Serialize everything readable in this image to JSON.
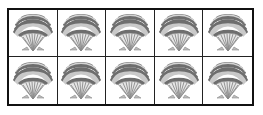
{
  "frame": {
    "rows": 2,
    "columns": 5,
    "border_color": "#111111"
  },
  "cells": [
    {
      "icon": "scallop-shell-icon"
    },
    {
      "icon": "scallop-shell-icon"
    },
    {
      "icon": "scallop-shell-icon"
    },
    {
      "icon": "scallop-shell-icon"
    },
    {
      "icon": "scallop-shell-icon"
    },
    {
      "icon": "scallop-shell-icon"
    },
    {
      "icon": "scallop-shell-icon"
    },
    {
      "icon": "scallop-shell-icon"
    },
    {
      "icon": "scallop-shell-icon"
    },
    {
      "icon": "scallop-shell-icon"
    }
  ],
  "colors": {
    "shell_dark": "#6e6e6e",
    "shell_light": "#c9c9c9",
    "shell_rib": "#8a8a8a"
  }
}
